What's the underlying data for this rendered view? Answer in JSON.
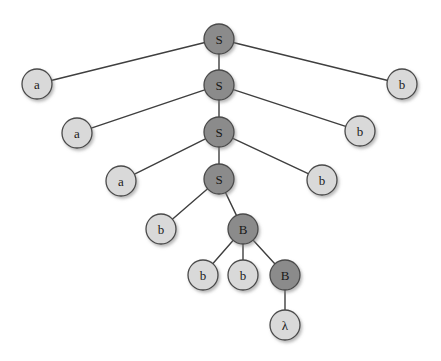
{
  "figure": {
    "type": "tree-diagram",
    "background_color": "#ffffff",
    "edge_color": "#3f3f3f",
    "node_stroke_color": "#4a4a4a",
    "nonterminal_fill": "#8b8b8b",
    "terminal_fill": "#d9d9d9",
    "node_radius": 15
  },
  "nodes": [
    {
      "id": "n0",
      "label": "S",
      "kind": "nonterminal",
      "x": 219,
      "y": 39,
      "r": 15
    },
    {
      "id": "n1",
      "label": "a",
      "kind": "terminal",
      "x": 37,
      "y": 84,
      "r": 15
    },
    {
      "id": "n2",
      "label": "S",
      "kind": "nonterminal",
      "x": 219,
      "y": 85,
      "r": 15
    },
    {
      "id": "n3",
      "label": "b",
      "kind": "terminal",
      "x": 402,
      "y": 84,
      "r": 15
    },
    {
      "id": "n4",
      "label": "a",
      "kind": "terminal",
      "x": 77,
      "y": 133,
      "r": 15
    },
    {
      "id": "n5",
      "label": "S",
      "kind": "nonterminal",
      "x": 219,
      "y": 132,
      "r": 15
    },
    {
      "id": "n6",
      "label": "b",
      "kind": "terminal",
      "x": 360,
      "y": 131,
      "r": 15
    },
    {
      "id": "n7",
      "label": "a",
      "kind": "terminal",
      "x": 121,
      "y": 181,
      "r": 15
    },
    {
      "id": "n8",
      "label": "S",
      "kind": "nonterminal",
      "x": 219,
      "y": 179,
      "r": 15
    },
    {
      "id": "n9",
      "label": "b",
      "kind": "terminal",
      "x": 322,
      "y": 180,
      "r": 15
    },
    {
      "id": "n10",
      "label": "b",
      "kind": "terminal",
      "x": 161,
      "y": 229,
      "r": 15
    },
    {
      "id": "n11",
      "label": "B",
      "kind": "nonterminal",
      "x": 243,
      "y": 229,
      "r": 15
    },
    {
      "id": "n12",
      "label": "b",
      "kind": "terminal",
      "x": 203,
      "y": 275,
      "r": 15
    },
    {
      "id": "n13",
      "label": "b",
      "kind": "terminal",
      "x": 243,
      "y": 275,
      "r": 15
    },
    {
      "id": "n14",
      "label": "B",
      "kind": "nonterminal",
      "x": 285,
      "y": 275,
      "r": 15
    },
    {
      "id": "n15",
      "label": "λ",
      "kind": "terminal",
      "x": 285,
      "y": 325,
      "r": 15
    }
  ],
  "edges": [
    {
      "from": "n0",
      "to": "n1"
    },
    {
      "from": "n0",
      "to": "n2"
    },
    {
      "from": "n0",
      "to": "n3"
    },
    {
      "from": "n2",
      "to": "n4"
    },
    {
      "from": "n2",
      "to": "n5"
    },
    {
      "from": "n2",
      "to": "n6"
    },
    {
      "from": "n5",
      "to": "n7"
    },
    {
      "from": "n5",
      "to": "n8"
    },
    {
      "from": "n5",
      "to": "n9"
    },
    {
      "from": "n8",
      "to": "n10"
    },
    {
      "from": "n8",
      "to": "n11"
    },
    {
      "from": "n11",
      "to": "n12"
    },
    {
      "from": "n11",
      "to": "n13"
    },
    {
      "from": "n11",
      "to": "n14"
    },
    {
      "from": "n14",
      "to": "n15"
    }
  ]
}
